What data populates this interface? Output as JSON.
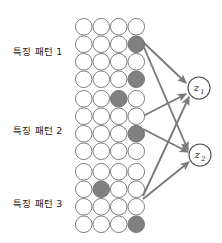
{
  "diagram": {
    "type": "neural-network-feature-map-to-output",
    "background_color": "#ffffff",
    "colors": {
      "circle_stroke": "#6e6e6e",
      "circle_empty_fill": "#ffffff",
      "circle_active_fill": "#808080",
      "arrow": "#7a7a7a",
      "node_stroke": "#4d4d4d",
      "text": "#1a1a1a"
    },
    "grid": {
      "rows": 4,
      "cols": 4,
      "circle_diameter": 17.5,
      "spacing": 17.5
    },
    "feature_maps": [
      {
        "id": "feature-map-1",
        "label": "특징 패턴 1",
        "label_x": 13,
        "label_y": 47,
        "origin_x": 75,
        "origin_y": 18,
        "active_cells": [
          {
            "row": 2,
            "col": 4
          },
          {
            "row": 4,
            "col": 4
          }
        ]
      },
      {
        "id": "feature-map-2",
        "label": "특징 패턴 2",
        "label_x": 13,
        "label_y": 126,
        "origin_x": 75,
        "origin_y": 90,
        "active_cells": [
          {
            "row": 1,
            "col": 3
          },
          {
            "row": 3,
            "col": 4
          }
        ]
      },
      {
        "id": "feature-map-3",
        "label": "특징 패턴 3",
        "label_x": 13,
        "label_y": 199,
        "origin_x": 75,
        "origin_y": 163,
        "active_cells": [
          {
            "row": 2,
            "col": 2
          },
          {
            "row": 4,
            "col": 4
          }
        ]
      }
    ],
    "output_nodes": [
      {
        "id": "output-node-z1",
        "base": "z",
        "subscript": "1",
        "cx": 199,
        "cy": 88,
        "r": 11
      },
      {
        "id": "output-node-z2",
        "base": "z",
        "subscript": "2",
        "cx": 200,
        "cy": 155,
        "r": 11
      }
    ],
    "connections": [
      {
        "id": "conn-fm1-z1",
        "from": "feature-map-1",
        "to": "output-node-z1",
        "x1": 143,
        "y1": 42,
        "x2": 186,
        "y2": 83
      },
      {
        "id": "conn-fm1-z2",
        "from": "feature-map-1",
        "to": "output-node-z2",
        "x1": 143,
        "y1": 45,
        "x2": 188,
        "y2": 150
      },
      {
        "id": "conn-fm2-z1",
        "from": "feature-map-2",
        "to": "output-node-z1",
        "x1": 143,
        "y1": 116,
        "x2": 186,
        "y2": 94
      },
      {
        "id": "conn-fm2-z2",
        "from": "feature-map-2",
        "to": "output-node-z2",
        "x1": 143,
        "y1": 129,
        "x2": 188,
        "y2": 152
      },
      {
        "id": "conn-fm3-z1",
        "from": "feature-map-3",
        "to": "output-node-z1",
        "x1": 143,
        "y1": 196,
        "x2": 189,
        "y2": 97
      },
      {
        "id": "conn-fm3-z2",
        "from": "feature-map-3",
        "to": "output-node-z2",
        "x1": 143,
        "y1": 199,
        "x2": 189,
        "y2": 162
      }
    ]
  }
}
